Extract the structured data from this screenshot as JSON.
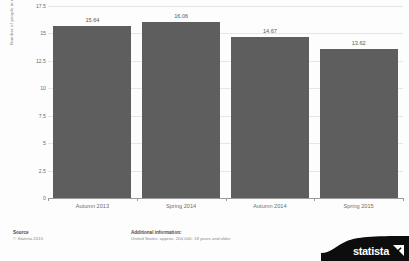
{
  "chart_data": {
    "type": "bar",
    "title": "",
    "subtitle": "",
    "xlabel": "",
    "ylabel": "Number of people in millions",
    "categories": [
      "Autumn 2013",
      "Spring 2014",
      "Autumn 2014",
      "Spring 2015"
    ],
    "values": [
      15.64,
      16.06,
      14.67,
      13.62
    ],
    "value_labels": [
      "15.64",
      "16.06",
      "14.67",
      "13.62"
    ],
    "ylim": [
      0,
      17.5
    ],
    "yticks": [
      17.5,
      15,
      12.5,
      10,
      7.5,
      5,
      2.5,
      0
    ],
    "ytick_labels": [
      "17.5",
      "15",
      "12.5",
      "10",
      "7.5",
      "5",
      "2.5",
      "0"
    ],
    "grid": true,
    "legend": false,
    "bar_color": "#5e5e5e",
    "grid_color": "#e6e6e6",
    "axis_color": "#9a9a9a"
  },
  "footer": {
    "source_heading": "Source",
    "source_text": "© Statista 2015",
    "additional_heading": "Additional information:",
    "additional_text": "United States; approx. 204,000; 18 years and older"
  },
  "logo": {
    "wordmark": "statista"
  }
}
